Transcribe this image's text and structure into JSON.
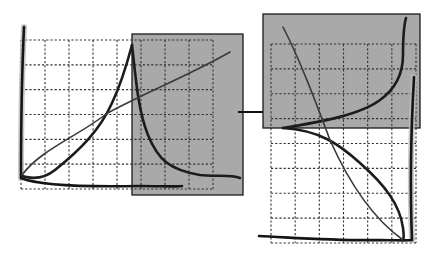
{
  "diagram": {
    "colors": {
      "shade": "#a9a9a9",
      "ink": "#1c1c1c",
      "grid": "#333333",
      "background": "#ffffff"
    },
    "left_panel": {
      "grid": {
        "x0": 21,
        "x1": 213,
        "y0": 40,
        "y1": 189,
        "cols": 8,
        "rows": 6
      },
      "shaded_box": {
        "x": 132,
        "y": 34,
        "w": 111,
        "h": 161
      },
      "axis_vertical": "M24,27 C22,70 21,130 21,178",
      "axis_horizontal": "M21,178 C40,186 90,187 140,186 C160,186 175,187 182,186",
      "curves": [
        {
          "name": "rising-peak-curve",
          "path": "M22,176 C35,180 45,178 55,170 C80,150 100,130 112,103 C122,82 128,60 132,45"
        },
        {
          "name": "decay-curve",
          "path": "M132,45 C136,80 138,110 148,135 C158,160 170,170 200,175 C215,177 230,174 240,178"
        },
        {
          "name": "straight-line",
          "path": "M22,175 C40,150 80,135 106,114 C140,95 190,75 230,52"
        }
      ]
    },
    "arrow": {
      "x1": 238,
      "y1": 112,
      "x2": 298,
      "y2": 112
    },
    "right_panel": {
      "grid": {
        "x0": 271,
        "x1": 416,
        "y0": 44,
        "y1": 243,
        "cols": 6,
        "rows": 8
      },
      "shaded_box": {
        "x": 263,
        "y": 14,
        "w": 157,
        "h": 114
      },
      "axis_vertical": "M414,77 C411,130 410,190 412,240",
      "axis_horizontal": "M259,236 C300,238 340,241 380,240 C395,240 405,241 412,240",
      "curves": [
        {
          "name": "upper-rising-curve",
          "path": "M283,128 C320,122 360,115 380,100 C398,87 403,70 403,55 C403,35 404,25 406,18"
        },
        {
          "name": "lower-falling-curve",
          "path": "M283,128 C320,130 340,145 360,163 C385,185 400,205 403,228 C404,235 404,238 403,240"
        },
        {
          "name": "diagonal-line",
          "path": "M283,27 C300,60 315,100 330,140 C350,185 375,220 403,240"
        }
      ]
    }
  }
}
